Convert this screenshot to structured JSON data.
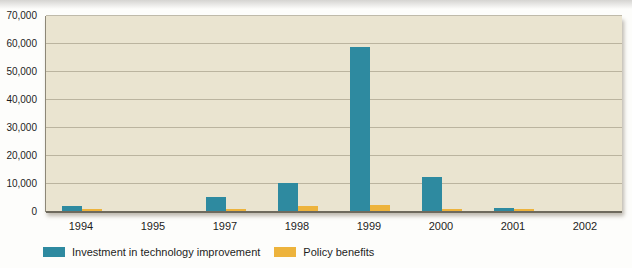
{
  "chart_data": {
    "type": "bar",
    "title": "",
    "xlabel": "",
    "ylabel": "",
    "categories": [
      "1994",
      "1995",
      "1997",
      "1998",
      "1999",
      "2000",
      "2001",
      "2002"
    ],
    "series": [
      {
        "name": "Investment in technology improvement",
        "color": "#2e8aa0",
        "values": [
          2000,
          0,
          5500,
          10500,
          59000,
          12500,
          1300,
          0
        ]
      },
      {
        "name": "Policy benefits",
        "color": "#edb33c",
        "values": [
          1000,
          0,
          1000,
          2000,
          2500,
          1000,
          1000,
          0
        ]
      }
    ],
    "ylim": [
      0,
      70000
    ],
    "yticks": [
      {
        "label": "70,000",
        "value": 70000
      },
      {
        "label": "60,000",
        "value": 60000
      },
      {
        "label": "50,000",
        "value": 50000
      },
      {
        "label": "40,000",
        "value": 40000
      },
      {
        "label": "30,000",
        "value": 30000
      },
      {
        "label": "20,000",
        "value": 20000
      },
      {
        "label": "10,000",
        "value": 10000
      },
      {
        "label": "0",
        "value": 0
      }
    ],
    "grid": true,
    "legend_position": "bottom-left",
    "plot_bg": "#eae4d0",
    "grid_color": "#aba48f",
    "axis_color": "#6e6a5d",
    "text_color": "#1d1d1d"
  }
}
